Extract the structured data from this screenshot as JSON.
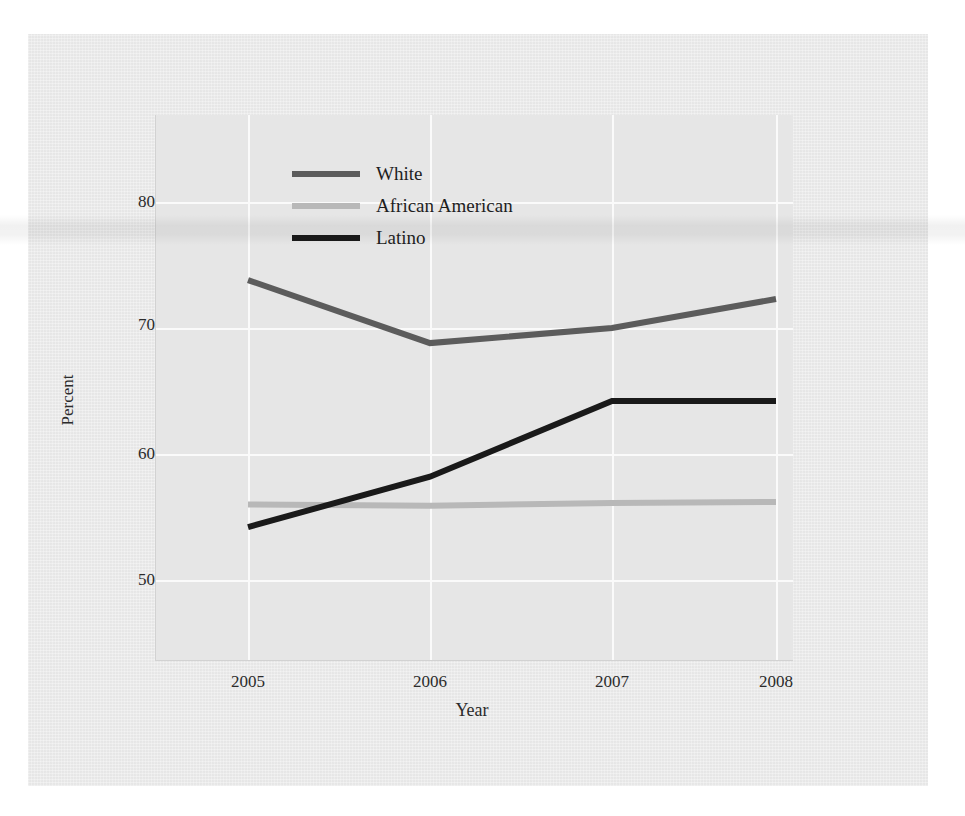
{
  "chart_data": {
    "type": "line",
    "title": "",
    "xlabel": "Year",
    "ylabel": "Percent",
    "categories": [
      "2005",
      "2006",
      "2007",
      "2008"
    ],
    "x": [
      2005,
      2006,
      2007,
      2008
    ],
    "xlim": [
      2004.75,
      2008.25
    ],
    "ylim": [
      45,
      84
    ],
    "yticks": [
      50,
      60,
      70,
      80
    ],
    "ytick_labels": [
      "50",
      "60",
      "70",
      "80"
    ],
    "xticks": [
      2005,
      2006,
      2007,
      2008
    ],
    "xtick_labels": [
      "2005",
      "2006",
      "2007",
      "2008"
    ],
    "grid": true,
    "grid_color": "#fafafa",
    "plot_background": "#e6e6e6",
    "legend_position": "upper-center",
    "series": [
      {
        "name": "White",
        "color": "#5c5c5c",
        "values": [
          73.8,
          68.8,
          70.0,
          72.3
        ]
      },
      {
        "name": "African American",
        "color": "#b8b8b8",
        "values": [
          56.0,
          55.9,
          56.1,
          56.2
        ]
      },
      {
        "name": "Latino",
        "color": "#1a1a1a",
        "values": [
          54.2,
          58.2,
          64.2,
          64.2
        ]
      }
    ]
  },
  "legend": {
    "items": [
      {
        "label": "White",
        "color": "#5c5c5c"
      },
      {
        "label": "African American",
        "color": "#b8b8b8"
      },
      {
        "label": "Latino",
        "color": "#1a1a1a"
      }
    ]
  },
  "axes": {
    "y_label": "Percent",
    "x_label": "Year",
    "y_ticks": [
      "80",
      "70",
      "60",
      "50"
    ],
    "x_ticks": [
      "2005",
      "2006",
      "2007",
      "2008"
    ]
  },
  "page": {
    "background": "#ebebeb",
    "paper_tone": "#ebebeb"
  }
}
